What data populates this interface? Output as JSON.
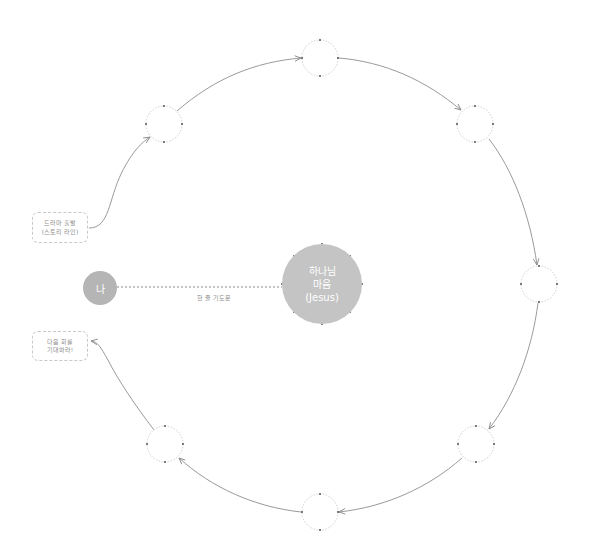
{
  "diagram": {
    "type": "cycle-diagram",
    "colors": {
      "node_fill": "#b5b5b5",
      "center_fill": "#c4c4c4",
      "stroke": "#9a9a9a",
      "dashed": "#c8c8c8",
      "text_light": "#8a8a8a"
    },
    "me_node": {
      "label": "나"
    },
    "center_node": {
      "line1": "하나님",
      "line2": "마음",
      "line3": "(Jesus)"
    },
    "connector": {
      "label": "한 줄 기도문"
    },
    "start_box": {
      "line1": "드라마 출발",
      "line2": "(스토리 라인)"
    },
    "end_box": {
      "line1": "다음 회를",
      "line2": "기대하라!"
    },
    "cycle_nodes": [
      {
        "id": "top-left",
        "cx": 164,
        "cy": 124
      },
      {
        "id": "top",
        "cx": 320,
        "cy": 58
      },
      {
        "id": "top-right",
        "cx": 475,
        "cy": 124
      },
      {
        "id": "right",
        "cx": 539,
        "cy": 284
      },
      {
        "id": "bottom-right",
        "cx": 476,
        "cy": 444
      },
      {
        "id": "bottom",
        "cx": 320,
        "cy": 512
      },
      {
        "id": "bottom-left",
        "cx": 165,
        "cy": 444
      }
    ]
  }
}
